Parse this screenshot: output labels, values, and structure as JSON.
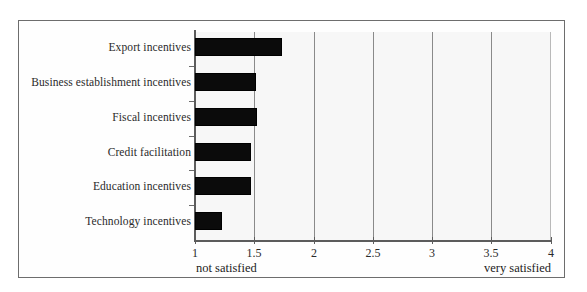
{
  "chart_data": {
    "type": "bar",
    "orientation": "horizontal",
    "title": "",
    "subtitle": "",
    "xlabel": "",
    "ylabel": "",
    "categories": [
      "Export incentives",
      "Business establishment incentives",
      "Fiscal incentives",
      "Credit facilitation",
      "Education incentives",
      "Technology incentives"
    ],
    "values": [
      1.73,
      1.51,
      1.52,
      1.47,
      1.47,
      1.23
    ],
    "series": [
      {
        "name": "Satisfaction level",
        "values": [
          1.73,
          1.51,
          1.52,
          1.47,
          1.47,
          1.23
        ]
      }
    ],
    "xlim": [
      1,
      4
    ],
    "xticks": [
      1,
      1.5,
      2,
      2.5,
      3,
      3.5,
      4
    ],
    "xticklabels": [
      "1",
      "1.5",
      "2",
      "2.5",
      "3",
      "3.5",
      "4"
    ],
    "grid": "vertical",
    "legend": "none",
    "bar_color": "#0b0b0b",
    "plot_background": "#f7f7f7",
    "annotations": {
      "low_anchor": "not satisfied",
      "high_anchor": "very satisfied"
    }
  }
}
